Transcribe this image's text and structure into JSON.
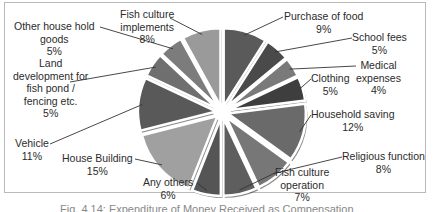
{
  "chart_data": {
    "type": "pie",
    "title": "",
    "exploded": true,
    "start_angle_deg": 0,
    "direction": "clockwise",
    "categories": [
      "Purchase of food",
      "School fees",
      "Medical expenses",
      "Clothing",
      "Household saving",
      "Religious function",
      "Fish culture operation",
      "Any others",
      "House Building",
      "Vehicle",
      "Land development for fish pond / fencing etc.",
      "Other house hold goods",
      "Fish culture implements"
    ],
    "values": [
      9,
      5,
      4,
      5,
      12,
      8,
      7,
      6,
      15,
      11,
      5,
      5,
      8
    ],
    "unit": "%",
    "colors": [
      "#5a5a5a",
      "#4a4a4a",
      "#7a7a7a",
      "#3e3e3e",
      "#6a6a6a",
      "#777777",
      "#5e5e5e",
      "#555555",
      "#a0a0a0",
      "#595959",
      "#6f6f6f",
      "#7c7c7c",
      "#9a9a9a"
    ],
    "legend": "none (data labels with leader lines)"
  },
  "labels": {
    "food": {
      "name": "Purchase of food",
      "pct": "9%"
    },
    "school": {
      "name": "School fees",
      "pct": "5%"
    },
    "medical": {
      "name1": "Medical",
      "name2": "expenses",
      "pct": "4%"
    },
    "clothing": {
      "name": "Clothing",
      "pct": "5%"
    },
    "saving": {
      "name": "Household saving",
      "pct": "12%"
    },
    "religious": {
      "name": "Religious function",
      "pct": "8%"
    },
    "operation": {
      "name1": "Fish culture",
      "name2": "operation",
      "pct": "7%"
    },
    "others": {
      "name": "Any others",
      "pct": "6%"
    },
    "house": {
      "name": "House Building",
      "pct": "15%"
    },
    "vehicle": {
      "name": "Vehicle",
      "pct": "11%"
    },
    "land": {
      "name1": "Land",
      "name2": "development for",
      "name3": "fish pond /",
      "name4": "fencing etc.",
      "pct": "5%"
    },
    "goods": {
      "name1": "Other house hold",
      "name2": "goods",
      "pct": "5%"
    },
    "implements": {
      "name1": "Fish culture",
      "name2": "implements",
      "pct": "8%"
    }
  },
  "caption": "Fig. 4.14: Expenditure of Money Received as Compensation"
}
